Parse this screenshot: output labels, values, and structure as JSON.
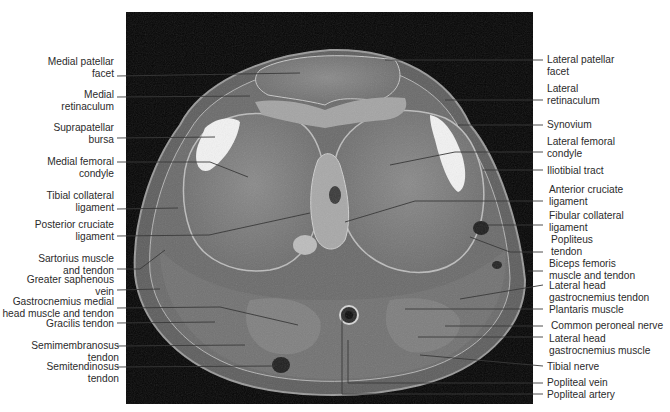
{
  "figure": {
    "type": "axial MRI knee anatomy",
    "colors": {
      "background": "#ffffff",
      "mri_frame": "#050505",
      "leader_line": "#3a3a3a",
      "label_text": "#2b2b2b"
    }
  },
  "labels_left": [
    {
      "id": "medial-patellar-facet",
      "lines": [
        "Medial patellar",
        "facet"
      ]
    },
    {
      "id": "medial-retinaculum",
      "lines": [
        "Medial",
        "retinaculum"
      ]
    },
    {
      "id": "suprapatellar-bursa",
      "lines": [
        "Suprapatellar",
        "bursa"
      ]
    },
    {
      "id": "medial-femoral-condyle",
      "lines": [
        "Medial femoral",
        "condyle"
      ]
    },
    {
      "id": "tibial-collateral-ligament",
      "lines": [
        "Tibial collateral",
        "ligament"
      ]
    },
    {
      "id": "posterior-cruciate-ligament",
      "lines": [
        "Posterior cruciate",
        "ligament"
      ]
    },
    {
      "id": "sartorius-muscle-and-tendon",
      "lines": [
        "Sartorius muscle",
        "and tendon"
      ]
    },
    {
      "id": "greater-saphenous-vein",
      "lines": [
        "Greater saphenous",
        "vein"
      ]
    },
    {
      "id": "gastrocnemius-medial-head",
      "lines": [
        "Gastrocnemius medial",
        "head muscle and tendon"
      ]
    },
    {
      "id": "gracilis-tendon",
      "lines": [
        "Gracilis tendon"
      ]
    },
    {
      "id": "semimembranosus-tendon",
      "lines": [
        "Semimembranosus",
        "tendon"
      ]
    },
    {
      "id": "semitendinosus-tendon",
      "lines": [
        "Semitendinosus",
        "tendon"
      ]
    }
  ],
  "labels_right": [
    {
      "id": "lateral-patellar-facet",
      "lines": [
        "Lateral patellar",
        "facet"
      ]
    },
    {
      "id": "lateral-retinaculum",
      "lines": [
        "Lateral",
        "retinaculum"
      ]
    },
    {
      "id": "synovium",
      "lines": [
        "Synovium"
      ]
    },
    {
      "id": "lateral-femoral-condyle",
      "lines": [
        "Lateral femoral",
        "condyle"
      ]
    },
    {
      "id": "iliotibial-tract",
      "lines": [
        "Iliotibial tract"
      ]
    },
    {
      "id": "anterior-cruciate-ligament",
      "lines": [
        "Anterior cruciate",
        "ligament"
      ]
    },
    {
      "id": "fibular-collateral-ligament",
      "lines": [
        "Fibular collateral",
        "ligament"
      ]
    },
    {
      "id": "popliteus-tendon",
      "lines": [
        "Popliteus",
        "tendon"
      ]
    },
    {
      "id": "biceps-femoris",
      "lines": [
        "Biceps femoris",
        "muscle and tendon"
      ]
    },
    {
      "id": "lateral-head-gastrocnemius-tendon",
      "lines": [
        "Lateral head",
        "gastrocnemius tendon"
      ]
    },
    {
      "id": "plantaris-muscle",
      "lines": [
        "Plantaris muscle"
      ]
    },
    {
      "id": "common-peroneal-nerve",
      "lines": [
        "Common peroneal nerve"
      ]
    },
    {
      "id": "lateral-head-gastrocnemius-muscle",
      "lines": [
        "Lateral head",
        "gastrocnemius muscle"
      ]
    },
    {
      "id": "tibial-nerve",
      "lines": [
        "Tibial nerve"
      ]
    },
    {
      "id": "popliteal-vein",
      "lines": [
        "Popliteal vein"
      ]
    },
    {
      "id": "popliteal-artery",
      "lines": [
        "Popliteal artery"
      ]
    }
  ]
}
